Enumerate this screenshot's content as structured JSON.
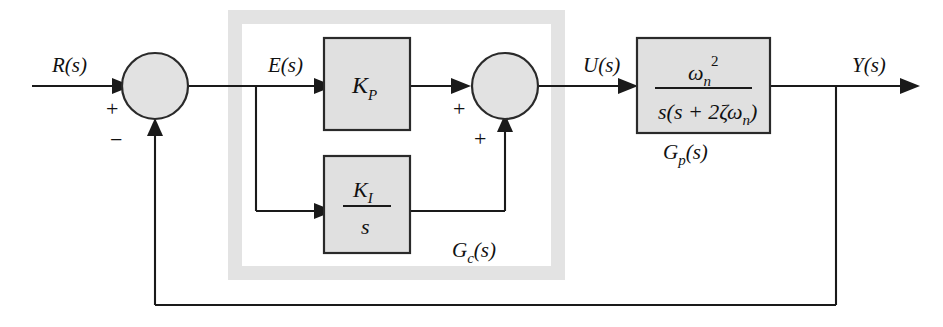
{
  "diagram": {
    "type": "control-system-block-diagram",
    "background_color": "#ffffff",
    "line_color": "#1a1a1a",
    "block_fill": "#e0e0e0",
    "group_band_color": "#e3e3e3"
  },
  "signals": {
    "reference": "R(s)",
    "error": "E(s)",
    "control": "U(s)",
    "output": "Y(s)"
  },
  "summing_junctions": [
    {
      "id": "error-junction",
      "signs": [
        "+",
        "−"
      ],
      "input_sign": "+",
      "feedback_sign": "−"
    },
    {
      "id": "control-junction",
      "signs": [
        "+",
        "+"
      ],
      "input_sign": "+",
      "feedback_sign": "+"
    }
  ],
  "blocks": {
    "proportional": {
      "name": "proportional-gain",
      "label": "K",
      "subscript": "P"
    },
    "integral": {
      "name": "integral-gain",
      "numerator_label": "K",
      "numerator_subscript": "I",
      "denominator": "s"
    },
    "plant": {
      "name": "plant-transfer-function",
      "numerator_base": "ω",
      "numerator_subscript": "n",
      "numerator_superscript": "2",
      "denominator_prefix": "s(s + 2",
      "denominator_zeta": "ζ",
      "denominator_omega": "ω",
      "denominator_omega_subscript": "n",
      "denominator_suffix": ")"
    }
  },
  "group_labels": {
    "controller": "G",
    "controller_subscript": "c",
    "controller_suffix": "(s)",
    "plant": "G",
    "plant_subscript": "p",
    "plant_suffix": "(s)"
  }
}
